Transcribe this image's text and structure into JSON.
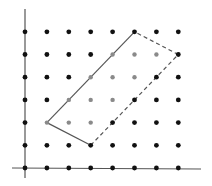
{
  "diagram": {
    "type": "lattice-parallelogram",
    "grid": {
      "cols": 8,
      "rows": 7,
      "origin_px": [
        25,
        168
      ],
      "col_spacing_px": 21.9,
      "row_spacing_px": 22.7,
      "dot_color": "#111111",
      "highlight_color": "#8a8a8a"
    },
    "axes": {
      "color": "#555555",
      "x_axis": {
        "from": [
          12,
          168
        ],
        "to": [
          201,
          169
        ]
      },
      "y_axis": {
        "from": [
          25,
          9
        ],
        "to": [
          25,
          178
        ]
      }
    },
    "highlighted_points": [
      [
        1,
        2
      ],
      [
        2,
        2
      ],
      [
        3,
        2
      ],
      [
        2,
        3
      ],
      [
        3,
        3
      ],
      [
        4,
        3
      ],
      [
        3,
        4
      ],
      [
        4,
        4
      ],
      [
        5,
        4
      ],
      [
        4,
        5
      ],
      [
        5,
        5
      ],
      [
        6,
        5
      ]
    ],
    "parallelogram": {
      "vertices": [
        [
          1,
          2
        ],
        [
          3,
          1
        ],
        [
          7,
          5
        ],
        [
          5,
          6
        ]
      ],
      "solid_edges": [
        [
          [
            5,
            6
          ],
          [
            1,
            2
          ]
        ],
        [
          [
            1,
            2
          ],
          [
            3,
            1
          ]
        ]
      ],
      "dashed_edges": [
        [
          [
            3,
            1
          ],
          [
            7,
            5
          ]
        ],
        [
          [
            7,
            5
          ],
          [
            5,
            6
          ]
        ]
      ],
      "line_color": "#555555"
    }
  }
}
